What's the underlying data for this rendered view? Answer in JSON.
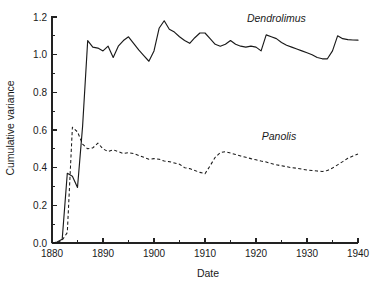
{
  "chart_data": {
    "type": "line",
    "title": "",
    "xlabel": "Date",
    "ylabel": "Cumulative variance",
    "xlim": [
      1880,
      1940
    ],
    "ylim": [
      0.0,
      1.2
    ],
    "grid": false,
    "legend_position": "inline-annotation",
    "x_ticks": [
      1880,
      1890,
      1900,
      1910,
      1920,
      1930,
      1940
    ],
    "x_tick_labels": [
      "1880",
      "1890",
      "1900",
      "1910",
      "1920",
      "1930",
      "1940"
    ],
    "x_minor_ticks": [
      1885,
      1895,
      1905,
      1915,
      1925,
      1935
    ],
    "y_ticks": [
      0.0,
      0.2,
      0.4,
      0.6,
      0.8,
      1.0,
      1.2
    ],
    "y_tick_labels": [
      "0.0",
      "0.2",
      "0.4",
      "0.6",
      "0.8",
      "1.0",
      "1.2"
    ],
    "y_minor_ticks": [
      0.1,
      0.3,
      0.5,
      0.7,
      0.9,
      1.1
    ],
    "series": [
      {
        "name": "Dendrolimus",
        "style": "solid",
        "label_x": 1924.0,
        "label_y": 1.175,
        "x": [
          1880,
          1881,
          1882,
          1883,
          1884,
          1885,
          1886,
          1887,
          1888,
          1889,
          1890,
          1891,
          1892,
          1893,
          1894,
          1895,
          1896,
          1897,
          1898,
          1899,
          1900,
          1901,
          1902,
          1903,
          1904,
          1905,
          1906,
          1907,
          1908,
          1909,
          1910,
          1911,
          1912,
          1913,
          1914,
          1915,
          1916,
          1917,
          1918,
          1919,
          1920,
          1921,
          1922,
          1923,
          1924,
          1925,
          1926,
          1927,
          1928,
          1929,
          1930,
          1931,
          1932,
          1933,
          1934,
          1935,
          1936,
          1937,
          1938,
          1939,
          1940
        ],
        "y": [
          0.0,
          0.005,
          0.02,
          0.37,
          0.355,
          0.295,
          0.62,
          1.075,
          1.04,
          1.035,
          1.02,
          1.045,
          0.985,
          1.045,
          1.075,
          1.095,
          1.06,
          1.025,
          0.995,
          0.965,
          1.02,
          1.14,
          1.18,
          1.135,
          1.12,
          1.095,
          1.075,
          1.06,
          1.09,
          1.115,
          1.115,
          1.085,
          1.055,
          1.045,
          1.055,
          1.075,
          1.055,
          1.045,
          1.04,
          1.045,
          1.04,
          1.02,
          1.105,
          1.095,
          1.085,
          1.065,
          1.05,
          1.04,
          1.03,
          1.02,
          1.01,
          1.0,
          0.985,
          0.978,
          0.978,
          1.02,
          1.1,
          1.085,
          1.08,
          1.078,
          1.077
        ]
      },
      {
        "name": "Panolis",
        "style": "dashed",
        "label_x": 1924.5,
        "label_y": 0.545,
        "x": [
          1880,
          1881,
          1882,
          1883,
          1884,
          1885,
          1886,
          1887,
          1888,
          1889,
          1890,
          1891,
          1892,
          1893,
          1894,
          1895,
          1896,
          1897,
          1898,
          1899,
          1900,
          1901,
          1902,
          1903,
          1904,
          1905,
          1906,
          1907,
          1908,
          1909,
          1910,
          1911,
          1912,
          1913,
          1914,
          1915,
          1916,
          1917,
          1918,
          1919,
          1920,
          1921,
          1922,
          1923,
          1924,
          1925,
          1926,
          1927,
          1928,
          1929,
          1930,
          1931,
          1932,
          1933,
          1934,
          1935,
          1936,
          1937,
          1938,
          1939,
          1940
        ],
        "y": [
          0.0,
          0.0,
          0.015,
          0.055,
          0.615,
          0.59,
          0.525,
          0.5,
          0.505,
          0.53,
          0.5,
          0.485,
          0.495,
          0.485,
          0.475,
          0.48,
          0.475,
          0.465,
          0.455,
          0.445,
          0.448,
          0.445,
          0.435,
          0.432,
          0.425,
          0.418,
          0.4,
          0.395,
          0.385,
          0.375,
          0.368,
          0.41,
          0.455,
          0.48,
          0.485,
          0.478,
          0.47,
          0.462,
          0.455,
          0.448,
          0.442,
          0.435,
          0.43,
          0.422,
          0.415,
          0.41,
          0.405,
          0.4,
          0.397,
          0.392,
          0.388,
          0.385,
          0.382,
          0.38,
          0.385,
          0.398,
          0.415,
          0.432,
          0.45,
          0.462,
          0.472
        ]
      }
    ]
  }
}
